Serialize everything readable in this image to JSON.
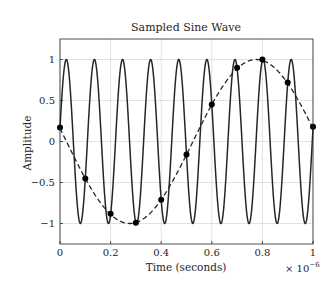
{
  "chart_data": {
    "type": "line",
    "title": "Sampled Sine Wave",
    "xlabel": "Time (seconds)",
    "ylabel": "Amplitude",
    "x_multiplier_label": "× 10",
    "x_multiplier_exponent": "−6",
    "xlim": [
      0,
      1
    ],
    "ylim": [
      -1.25,
      1.25
    ],
    "x_ticks": [
      0,
      0.2,
      0.4,
      0.6,
      0.8,
      1
    ],
    "x_tick_labels": [
      "0",
      "0.2",
      "0.4",
      "0.6",
      "0.8",
      "1"
    ],
    "y_ticks": [
      1,
      0.5,
      0,
      -0.5,
      -1
    ],
    "y_tick_labels": [
      "1",
      "0.5",
      "0",
      "−0.5",
      "−1"
    ],
    "grid": true,
    "legend": null,
    "series": [
      {
        "name": "Continuous signal (≈9 MHz)",
        "style": "solid",
        "color": "#262626",
        "frequency_mhz": 9,
        "phase_rad": 0.161
      },
      {
        "name": "Aliased reconstruction (≈1 MHz)",
        "style": "dashed",
        "color": "#262626",
        "frequency_mhz": -1,
        "phase_rad": 0.161
      },
      {
        "name": "Samples",
        "style": "markers",
        "color": "#000000",
        "x": [
          0,
          0.1,
          0.2,
          0.3,
          0.4,
          0.5,
          0.6,
          0.7,
          0.8,
          0.9,
          1.0
        ],
        "values": [
          0.17,
          -0.45,
          -0.88,
          -0.99,
          -0.71,
          -0.16,
          0.45,
          0.9,
          1.0,
          0.72,
          0.18
        ]
      }
    ]
  },
  "colors": {
    "line": "#262626",
    "grid": "#d9d9d9",
    "axis": "#262626"
  }
}
